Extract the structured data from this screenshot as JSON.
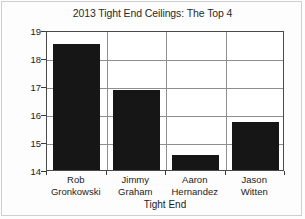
{
  "chart_data": {
    "type": "bar",
    "title": "2013 Tight End Ceilings: The Top 4",
    "xlabel": "Tight End",
    "ylabel": "PPG",
    "categories": [
      "Rob Gronkowski",
      "Jimmy Graham",
      "Aaron Hernandez",
      "Jason Witten"
    ],
    "category_lines": [
      [
        "Rob",
        "Gronkowski"
      ],
      [
        "Jimmy",
        "Graham"
      ],
      [
        "Aaron",
        "Hernandez"
      ],
      [
        "Jason",
        "Witten"
      ]
    ],
    "values": [
      18.5,
      16.85,
      14.55,
      15.7
    ],
    "ylim": [
      14,
      19
    ],
    "ytick_labels": [
      "19",
      "18",
      "17",
      "16",
      "15",
      "14"
    ],
    "ytick_values": [
      19,
      18,
      17,
      16,
      15,
      14
    ],
    "grid": true,
    "legend": "none",
    "bar_color": "#161616",
    "axis_color": "#4a4a4a",
    "grid_color": "#8e8e8e"
  }
}
